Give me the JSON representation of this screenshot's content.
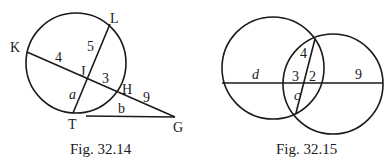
{
  "figures": [
    {
      "caption": "Fig. 32.14",
      "points": {
        "K": "K",
        "L": "L",
        "J": "J",
        "H": "H",
        "T": "T",
        "G": "G"
      },
      "segment_labels": {
        "KJ": "4",
        "LJ": "5",
        "JH": "3",
        "JT": "a",
        "HG": "9",
        "TG": "b"
      }
    },
    {
      "caption": "Fig. 32.15",
      "segment_labels": {
        "left": "d",
        "mid_left": "3",
        "mid_right": "2",
        "right": "9",
        "upper": "4",
        "lower": "c"
      }
    }
  ],
  "colors": {
    "stroke": "#1a1a1a",
    "background": "#ffffff"
  }
}
